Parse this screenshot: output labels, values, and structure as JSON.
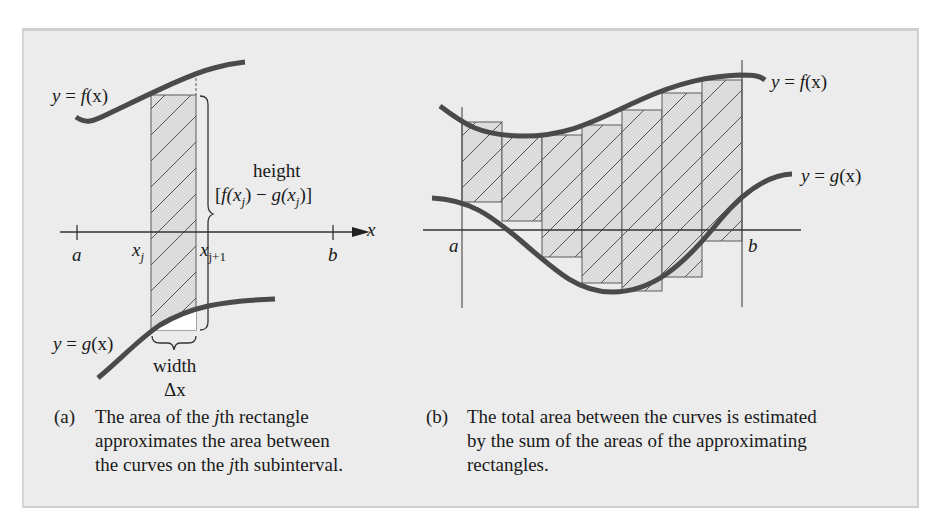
{
  "figure": {
    "panel_a": {
      "f_label_prefix": "y = ",
      "f_label_func": "f",
      "f_label_arg": "(x)",
      "g_label_prefix": "y = ",
      "g_label_func": "g",
      "g_label_arg": "(x)",
      "height_label": "height",
      "height_expr_open": "[",
      "height_expr_f": "f",
      "height_expr_x1": "(x",
      "height_expr_j1": "j",
      "height_expr_mid": ") − ",
      "height_expr_g": "g",
      "height_expr_x2": "(x",
      "height_expr_j2": "j",
      "height_expr_close": ")]",
      "axis_label": "x",
      "tick_a": "a",
      "tick_xj_base": "x",
      "tick_xj_sub": "j",
      "tick_xj1_base": "x",
      "tick_xj1_sub": "j+1",
      "tick_b": "b",
      "width_label": "width",
      "width_symbol": "Δx",
      "caption_tag": "(a)",
      "caption_line1_pre": "The area of the ",
      "caption_line1_j": "j",
      "caption_line1_post": "th rectangle",
      "caption_line2": "approximates the area between",
      "caption_line3_pre": "the curves on the ",
      "caption_line3_j": "j",
      "caption_line3_post": "th subinterval."
    },
    "panel_b": {
      "f_label_prefix": "y = ",
      "f_label_func": "f",
      "f_label_arg": "(x)",
      "g_label_prefix": "y = ",
      "g_label_func": "g",
      "g_label_arg": "(x)",
      "tick_a": "a",
      "tick_b": "b",
      "rectangle_count": 7,
      "caption_tag": "(b)",
      "caption_line1": "The total area between the curves is estimated",
      "caption_line2": "by the sum of the areas of the approximating",
      "caption_line3": "rectangles."
    },
    "colors": {
      "background": "#ececec",
      "curve": "#4a4a4a",
      "rect_fill": "#dcdcdc",
      "line": "#5a5a5a",
      "text": "#1a1a1a"
    }
  }
}
